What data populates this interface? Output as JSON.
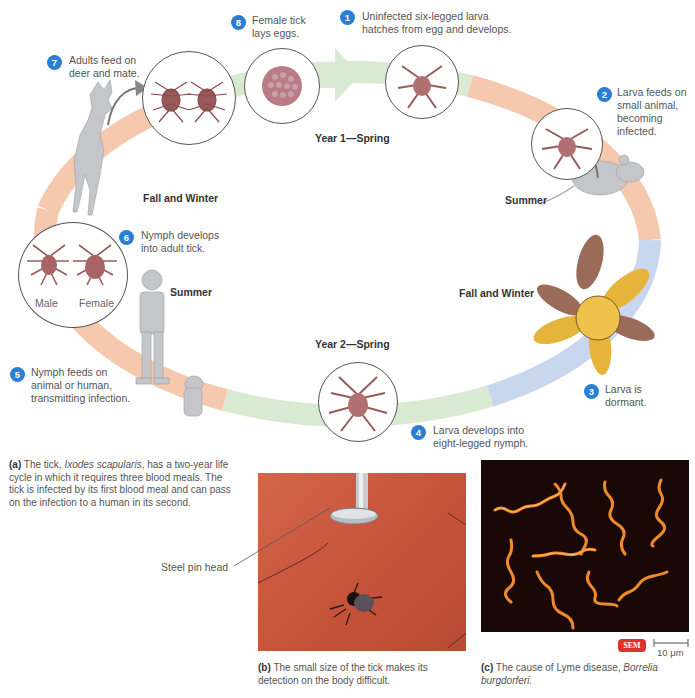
{
  "steps": [
    {
      "num": "1",
      "text_line1": "Uninfected six-legged larva",
      "text_line2": "hatches from egg and develops."
    },
    {
      "num": "2",
      "text_line1": "Larva feeds on",
      "text_line2": "small animal,",
      "text_line3": "becoming",
      "text_line4": "infected."
    },
    {
      "num": "3",
      "text_line1": "Larva is",
      "text_line2": "dormant."
    },
    {
      "num": "4",
      "text_line1": "Larva develops into",
      "text_line2": "eight-legged nymph."
    },
    {
      "num": "5",
      "text_line1": "Nymph feeds on",
      "text_line2": "animal or human,",
      "text_line3": "transmitting infection."
    },
    {
      "num": "6",
      "text_line1": "Nymph develops",
      "text_line2": "into adult tick."
    },
    {
      "num": "7",
      "text_line1": "Adults feed on",
      "text_line2": "deer and mate."
    },
    {
      "num": "8",
      "text_line1": "Female tick",
      "text_line2": "lays eggs."
    }
  ],
  "seasons": {
    "year1_spring": "Year 1—Spring",
    "summer_right": "Summer",
    "fall_winter_right": "Fall and Winter",
    "year2_spring": "Year 2—Spring",
    "summer_left": "Summer",
    "fall_winter_left": "Fall and Winter"
  },
  "adult_labels": {
    "male": "Male",
    "female": "Female"
  },
  "colors": {
    "spring_band": "#d8ebd2",
    "summer_band": "#f6c9ae",
    "winter_band": "#c9d7ee",
    "badge": "#2a7fd4",
    "tick": "#9a5a5a",
    "skin": "#c8553c",
    "sem_badge": "#e0312b"
  },
  "captions": {
    "a_label": "(a)",
    "a_text1": " The tick, ",
    "a_species": "Ixodes scapularis",
    "a_text2": ", has a two-year life cycle in which it requires three blood meals. The tick is infected by its first blood meal and can pass on the infection to a human in its second.",
    "b_label": "(b)",
    "b_text": " The small size of the tick makes its detection on the body difficult.",
    "c_label": "(c)",
    "c_text": " The cause of Lyme disease, ",
    "c_species": "Borrelia burgdorferi",
    "c_end": "."
  },
  "photo_b": {
    "pointer_label": "Steel pin head"
  },
  "photo_c": {
    "sem_badge": "SEM",
    "scale_bar": "10 μm"
  }
}
